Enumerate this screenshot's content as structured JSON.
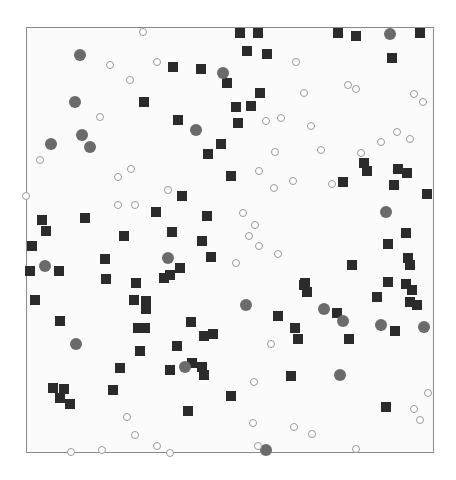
{
  "figure": {
    "frame": {
      "left": 26,
      "top": 27,
      "right": 434,
      "bottom": 453
    },
    "colors": {
      "square": "#2b2b2b",
      "filled_circle": "#6b6b6b",
      "hollow_circle_ring": "#9a9a9a",
      "frame": "#8a8a8a"
    }
  },
  "chart_data": {
    "type": "scatter",
    "title": "",
    "xlabel": "",
    "ylabel": "",
    "grid": false,
    "legend": null,
    "coordinate_space": "pixels",
    "series": [
      {
        "name": "squares",
        "marker": "square",
        "points": [
          [
            240,
            33
          ],
          [
            258,
            33
          ],
          [
            338,
            33
          ],
          [
            356,
            36
          ],
          [
            420,
            33
          ],
          [
            392,
            58
          ],
          [
            247,
            51
          ],
          [
            267,
            54
          ],
          [
            173,
            67
          ],
          [
            201,
            69
          ],
          [
            227,
            83
          ],
          [
            144,
            102
          ],
          [
            260,
            93
          ],
          [
            236,
            107
          ],
          [
            251,
            106
          ],
          [
            178,
            120
          ],
          [
            238,
            123
          ],
          [
            221,
            144
          ],
          [
            208,
            154
          ],
          [
            364,
            163
          ],
          [
            367,
            171
          ],
          [
            398,
            169
          ],
          [
            407,
            173
          ],
          [
            231,
            176
          ],
          [
            343,
            182
          ],
          [
            394,
            185
          ],
          [
            182,
            196
          ],
          [
            427,
            194
          ],
          [
            156,
            212
          ],
          [
            207,
            216
          ],
          [
            42,
            220
          ],
          [
            85,
            218
          ],
          [
            46,
            231
          ],
          [
            124,
            236
          ],
          [
            172,
            232
          ],
          [
            406,
            233
          ],
          [
            202,
            241
          ],
          [
            32,
            246
          ],
          [
            388,
            244
          ],
          [
            211,
            257
          ],
          [
            105,
            259
          ],
          [
            352,
            265
          ],
          [
            408,
            258
          ],
          [
            410,
            265
          ],
          [
            30,
            271
          ],
          [
            59,
            271
          ],
          [
            180,
            268
          ],
          [
            170,
            275
          ],
          [
            164,
            278
          ],
          [
            106,
            279
          ],
          [
            136,
            283
          ],
          [
            305,
            283
          ],
          [
            388,
            282
          ],
          [
            406,
            284
          ],
          [
            304,
            285
          ],
          [
            307,
            292
          ],
          [
            412,
            290
          ],
          [
            377,
            297
          ],
          [
            410,
            302
          ],
          [
            417,
            305
          ],
          [
            35,
            300
          ],
          [
            134,
            300
          ],
          [
            146,
            301
          ],
          [
            146,
            309
          ],
          [
            337,
            313
          ],
          [
            278,
            316
          ],
          [
            60,
            321
          ],
          [
            191,
            322
          ],
          [
            295,
            328
          ],
          [
            395,
            331
          ],
          [
            138,
            328
          ],
          [
            145,
            328
          ],
          [
            204,
            336
          ],
          [
            213,
            334
          ],
          [
            298,
            339
          ],
          [
            349,
            339
          ],
          [
            177,
            346
          ],
          [
            140,
            351
          ],
          [
            192,
            363
          ],
          [
            202,
            367
          ],
          [
            204,
            375
          ],
          [
            170,
            370
          ],
          [
            120,
            368
          ],
          [
            291,
            376
          ],
          [
            53,
            388
          ],
          [
            64,
            389
          ],
          [
            113,
            390
          ],
          [
            60,
            398
          ],
          [
            70,
            404
          ],
          [
            231,
            396
          ],
          [
            386,
            407
          ],
          [
            188,
            411
          ]
        ]
      },
      {
        "name": "filled_circles",
        "marker": "circle-filled",
        "points": [
          [
            80,
            55
          ],
          [
            390,
            34
          ],
          [
            223,
            73
          ],
          [
            75,
            102
          ],
          [
            196,
            130
          ],
          [
            82,
            135
          ],
          [
            51,
            144
          ],
          [
            90,
            147
          ],
          [
            386,
            212
          ],
          [
            168,
            258
          ],
          [
            45,
            266
          ],
          [
            246,
            305
          ],
          [
            324,
            309
          ],
          [
            343,
            321
          ],
          [
            381,
            325
          ],
          [
            424,
            327
          ],
          [
            76,
            344
          ],
          [
            185,
            367
          ],
          [
            340,
            375
          ],
          [
            266,
            450
          ]
        ]
      },
      {
        "name": "hollow_circles",
        "marker": "circle-open",
        "points": [
          [
            143,
            32
          ],
          [
            110,
            65
          ],
          [
            157,
            62
          ],
          [
            296,
            62
          ],
          [
            130,
            80
          ],
          [
            348,
            85
          ],
          [
            356,
            89
          ],
          [
            304,
            93
          ],
          [
            414,
            94
          ],
          [
            423,
            102
          ],
          [
            100,
            117
          ],
          [
            281,
            118
          ],
          [
            266,
            121
          ],
          [
            311,
            126
          ],
          [
            397,
            132
          ],
          [
            410,
            139
          ],
          [
            381,
            142
          ],
          [
            321,
            150
          ],
          [
            275,
            152
          ],
          [
            361,
            153
          ],
          [
            40,
            160
          ],
          [
            131,
            169
          ],
          [
            259,
            171
          ],
          [
            118,
            177
          ],
          [
            293,
            181
          ],
          [
            332,
            184
          ],
          [
            274,
            188
          ],
          [
            168,
            190
          ],
          [
            26,
            196
          ],
          [
            118,
            205
          ],
          [
            135,
            205
          ],
          [
            243,
            213
          ],
          [
            255,
            225
          ],
          [
            249,
            236
          ],
          [
            259,
            246
          ],
          [
            278,
            254
          ],
          [
            236,
            263
          ],
          [
            271,
            344
          ],
          [
            254,
            382
          ],
          [
            428,
            393
          ],
          [
            414,
            409
          ],
          [
            127,
            417
          ],
          [
            420,
            420
          ],
          [
            253,
            423
          ],
          [
            294,
            427
          ],
          [
            312,
            434
          ],
          [
            135,
            435
          ],
          [
            157,
            446
          ],
          [
            258,
            446
          ],
          [
            356,
            449
          ],
          [
            102,
            450
          ],
          [
            71,
            452
          ],
          [
            170,
            453
          ]
        ]
      }
    ]
  }
}
